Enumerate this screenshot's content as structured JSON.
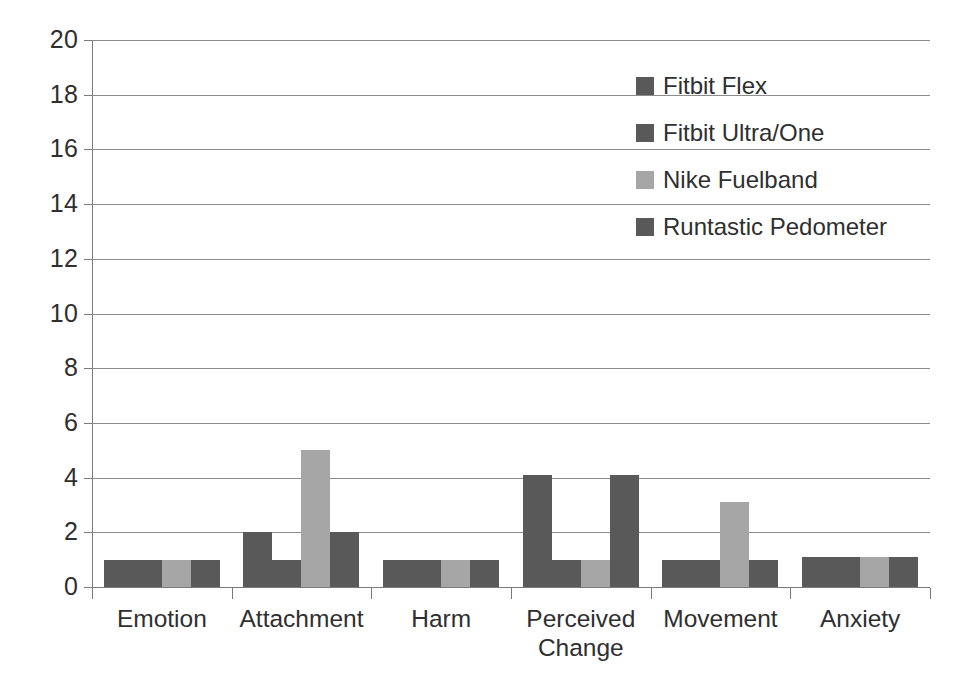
{
  "chart_data": {
    "type": "bar",
    "title": "",
    "subtitle": "",
    "xlabel": "",
    "ylabel": "",
    "ylim": [
      0,
      20
    ],
    "ytick_step": 2,
    "yticks": [
      "0",
      "2",
      "4",
      "6",
      "8",
      "10",
      "12",
      "14",
      "16",
      "18",
      "20"
    ],
    "grid": true,
    "grid_axis": "y",
    "legend_position": "top-right",
    "categories": [
      "Emotion",
      "Attachment",
      "Harm",
      "Perceived Change",
      "Movement",
      "Anxiety"
    ],
    "series": [
      {
        "name": "Fitbit Flex",
        "color": "#595959",
        "values": [
          1,
          2,
          1,
          4.1,
          1,
          1.1
        ]
      },
      {
        "name": "Fitbit Ultra/One",
        "color": "#595959",
        "values": [
          1,
          1,
          1,
          1,
          1,
          1.1
        ]
      },
      {
        "name": "Nike Fuelband",
        "color": "#a6a6a6",
        "values": [
          1,
          5,
          1,
          1,
          3.1,
          1.1
        ]
      },
      {
        "name": "Runtastic Pedometer",
        "color": "#595959",
        "values": [
          1,
          2,
          1,
          4.1,
          1,
          1.1
        ]
      }
    ]
  },
  "legend": {
    "items": [
      {
        "label": "Fitbit Flex",
        "color": "#595959"
      },
      {
        "label": "Fitbit Ultra/One",
        "color": "#595959"
      },
      {
        "label": "Nike Fuelband",
        "color": "#a6a6a6"
      },
      {
        "label": "Runtastic Pedometer",
        "color": "#595959"
      }
    ]
  },
  "axes": {
    "y_tick_labels": [
      "20",
      "18",
      "16",
      "14",
      "12",
      "10",
      "8",
      "6",
      "4",
      "2",
      "0"
    ],
    "x_tick_labels": [
      "Emotion",
      "Attachment",
      "Harm",
      "Perceived Change",
      "Movement",
      "Anxiety"
    ]
  },
  "colors": {
    "series_dark": "#595959",
    "series_light": "#a6a6a6",
    "gridline": "#8c8c8c",
    "axis": "#7a7a7a",
    "text": "#2f2f2f",
    "background": "#ffffff"
  }
}
